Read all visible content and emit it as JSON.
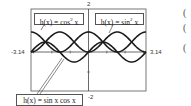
{
  "chart_data": {
    "type": "line",
    "title": "",
    "xlabel": "",
    "ylabel": "",
    "xlim": [
      -3.14,
      3.14
    ],
    "ylim": [
      -2,
      2
    ],
    "grid": false,
    "tick_labels": {
      "x_min": "-3.14",
      "x_max": "3.14",
      "y_max": "2",
      "y_min": "-2"
    },
    "series": [
      {
        "name": "h(x) = cos^2 x",
        "label_main": "h(x) = cos",
        "label_sup": "2",
        "label_tail": " x",
        "function": "cos(x)^2",
        "x": [
          -3.14,
          -2.36,
          -1.57,
          -0.79,
          0,
          0.79,
          1.57,
          2.36,
          3.14
        ],
        "values": [
          1,
          0.5,
          0,
          0.5,
          1,
          0.5,
          0,
          0.5,
          1
        ]
      },
      {
        "name": "h(x) = sin^2 x",
        "label_main": "h(x) = sin",
        "label_sup": "2",
        "label_tail": " x",
        "function": "sin(x)^2",
        "x": [
          -3.14,
          -2.36,
          -1.57,
          -0.79,
          0,
          0.79,
          1.57,
          2.36,
          3.14
        ],
        "values": [
          0,
          0.5,
          1,
          0.5,
          0,
          0.5,
          1,
          0.5,
          0
        ]
      },
      {
        "name": "h(x) = sin x cos x",
        "label_main": "h(x) = sin x cos x",
        "label_sup": "",
        "label_tail": "",
        "function": "sin(x)*cos(x)",
        "x": [
          -3.14,
          -2.36,
          -1.57,
          -0.79,
          0,
          0.79,
          1.57,
          2.36,
          3.14
        ],
        "values": [
          0,
          0.5,
          0,
          -0.5,
          0,
          0.5,
          0,
          -0.5,
          0
        ]
      }
    ],
    "annotations": [
      "h(x) = cos² x",
      "h(x) = sin² x",
      "h(x) = sin x cos x"
    ]
  },
  "side_marks": [
    "(",
    "(",
    "("
  ],
  "colors": {
    "curve": "#1a1a1a",
    "frame": "#555555",
    "axis": "#444444"
  }
}
